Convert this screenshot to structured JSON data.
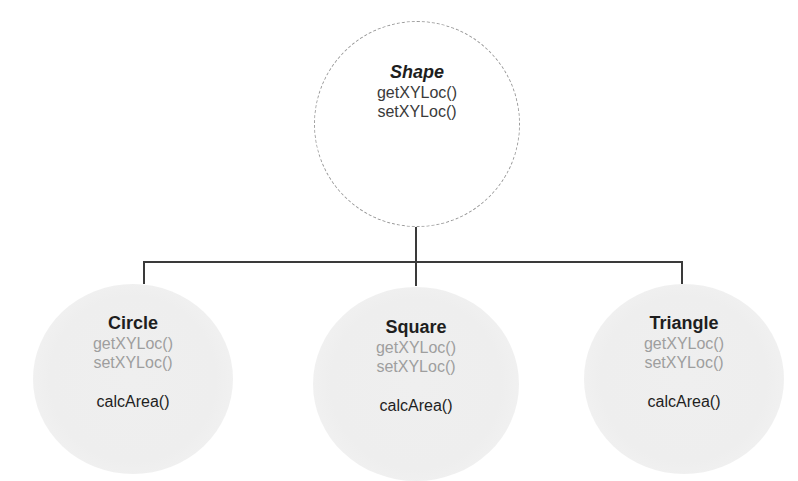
{
  "diagram": {
    "type": "inheritance-hierarchy",
    "parent": {
      "name": "Shape",
      "methods": [
        "getXYLoc()",
        "setXYLoc()"
      ],
      "style": "dashed-outline"
    },
    "children": [
      {
        "name": "Circle",
        "inherited_methods": [
          "getXYLoc()",
          "setXYLoc()"
        ],
        "own_methods": [
          "calcArea()"
        ]
      },
      {
        "name": "Square",
        "inherited_methods": [
          "getXYLoc()",
          "setXYLoc()"
        ],
        "own_methods": [
          "calcArea()"
        ]
      },
      {
        "name": "Triangle",
        "inherited_methods": [
          "getXYLoc()",
          "setXYLoc()"
        ],
        "own_methods": [
          "calcArea()"
        ]
      }
    ],
    "colors": {
      "connector": "#3a3a3a",
      "parent_border": "#9a9a9a",
      "child_fill": "#eeeeee",
      "inherited_text": "#9e9e9e",
      "text": "#1e1e1e"
    }
  }
}
